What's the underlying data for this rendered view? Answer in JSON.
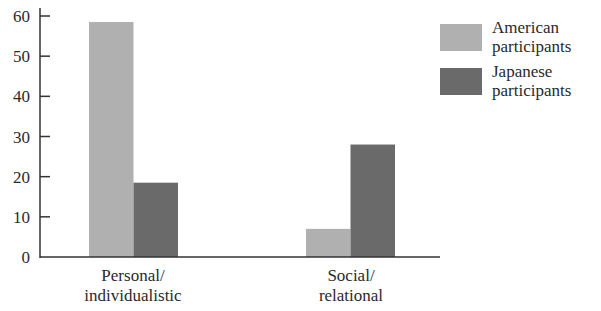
{
  "chart_data": {
    "type": "bar",
    "title": "",
    "xlabel": "",
    "ylabel": "",
    "ylim": [
      0,
      60
    ],
    "yticks": [
      0,
      10,
      20,
      30,
      40,
      50,
      60
    ],
    "categories": [
      "Personal/ individualistic",
      "Social/ relational"
    ],
    "category_lines": [
      [
        "Personal/",
        "individualistic"
      ],
      [
        "Social/",
        "relational"
      ]
    ],
    "series": [
      {
        "name": "American participants",
        "name_lines": [
          "American",
          "participants"
        ],
        "color": "#b0b0b0",
        "values": [
          58.5,
          7
        ]
      },
      {
        "name": "Japanese participants",
        "name_lines": [
          "Japanese",
          "participants"
        ],
        "color": "#6a6a6a",
        "values": [
          18.5,
          28
        ]
      }
    ],
    "grid": false,
    "legend_position": "upper right"
  }
}
